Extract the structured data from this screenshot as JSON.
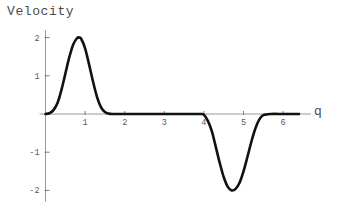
{
  "chart": {
    "title": "Velocity",
    "xaxis_name": "q",
    "yaxis_name": ""
  },
  "axis": {
    "x_ticks": [
      {
        "value": 1,
        "label": "1"
      },
      {
        "value": 2,
        "label": "2"
      },
      {
        "value": 3,
        "label": "3"
      },
      {
        "value": 4,
        "label": "4"
      },
      {
        "value": 5,
        "label": "5"
      },
      {
        "value": 6,
        "label": "6"
      }
    ],
    "y_ticks": [
      {
        "value": 2,
        "label": "2"
      },
      {
        "value": 1,
        "label": "1"
      },
      {
        "value": -1,
        "label": "-1"
      },
      {
        "value": -2,
        "label": "-2"
      }
    ]
  },
  "colors": {
    "curve": "#111111",
    "axis": "#9a9a9a",
    "tick": "#7d7d7d",
    "text": "#4a4a4a",
    "ticktext": "#5a5a5a",
    "background": "#ffffff"
  },
  "chart_data": {
    "type": "line",
    "title": "Velocity",
    "xlabel": "q",
    "ylabel": "Velocity",
    "xlim": [
      -0.15,
      6.55
    ],
    "ylim": [
      -2.35,
      2.3
    ],
    "grid": false,
    "legend": false,
    "x_ticks": [
      1,
      2,
      3,
      4,
      5,
      6
    ],
    "y_ticks": [
      2,
      1,
      -1,
      -2
    ],
    "annotations": [
      {
        "text": "positive peak",
        "x": 0.85,
        "y": 2.0
      },
      {
        "text": "negative trough",
        "x": 4.72,
        "y": -2.0
      }
    ],
    "series": [
      {
        "name": "Velocity",
        "x": [
          0.0,
          0.1,
          0.2,
          0.3,
          0.4,
          0.5,
          0.6,
          0.7,
          0.8,
          0.85,
          0.9,
          1.0,
          1.1,
          1.2,
          1.3,
          1.4,
          1.5,
          1.6,
          1.7,
          1.8,
          2.0,
          2.5,
          3.0,
          3.5,
          3.9,
          4.0,
          4.1,
          4.2,
          4.3,
          4.4,
          4.5,
          4.6,
          4.7,
          4.8,
          4.9,
          5.0,
          5.1,
          5.2,
          5.3,
          5.4,
          5.5,
          5.7,
          6.0,
          6.4
        ],
        "y": [
          0.0,
          0.02,
          0.1,
          0.28,
          0.62,
          1.05,
          1.48,
          1.82,
          1.99,
          2.0,
          1.97,
          1.72,
          1.3,
          0.85,
          0.45,
          0.18,
          0.05,
          0.01,
          0.0,
          0.0,
          0.0,
          0.0,
          0.0,
          0.0,
          0.0,
          -0.02,
          -0.18,
          -0.45,
          -0.86,
          -1.28,
          -1.65,
          -1.9,
          -2.0,
          -1.96,
          -1.8,
          -1.5,
          -1.12,
          -0.72,
          -0.38,
          -0.14,
          -0.03,
          0.0,
          0.0,
          0.0
        ]
      }
    ]
  }
}
